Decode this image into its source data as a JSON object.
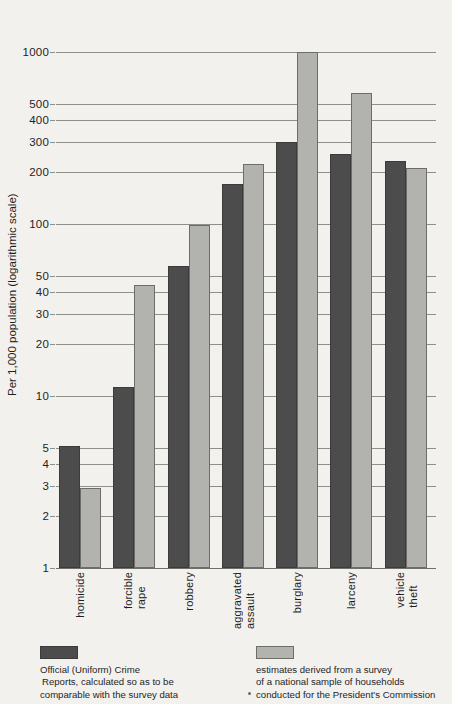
{
  "chart_data": {
    "type": "bar",
    "title": "",
    "xlabel": "",
    "ylabel": "Per 1,000 population (logarithmic scale)",
    "scale": "log",
    "ylim": [
      1,
      1200
    ],
    "grid": true,
    "legend_position": "bottom",
    "ticks": [
      1,
      2,
      3,
      4,
      5,
      10,
      20,
      30,
      40,
      50,
      100,
      200,
      300,
      400,
      500,
      1000
    ],
    "tick_labels": [
      "1",
      "2",
      "3",
      "4",
      "5",
      "10",
      "20",
      "30",
      "40",
      "50",
      "100",
      "200",
      "300",
      "400",
      "500",
      "1000"
    ],
    "categories": [
      "homicide",
      "forcible rape",
      "robbery",
      "aggravated assault",
      "burglary",
      "larceny",
      "vehicle theft"
    ],
    "category_lines": [
      [
        "homicide"
      ],
      [
        "forcible",
        "rape"
      ],
      [
        "robbery"
      ],
      [
        "aggravated",
        "assault"
      ],
      [
        "burglary"
      ],
      [
        "larceny"
      ],
      [
        "vehicle",
        "theft"
      ]
    ],
    "series": [
      {
        "name": "Official (Uniform) Crime Reports, calculated so as to be comparable with the survey data",
        "short_name": "official",
        "color": "#4c4c4c",
        "values": [
          5.1,
          11.3,
          57,
          170,
          298,
          255,
          232
        ]
      },
      {
        "name": "estimates derived from a survey of a national sample of households conducted for the President's Commission",
        "short_name": "survey",
        "color": "#b2b2ae",
        "values": [
          2.9,
          44,
          99,
          222,
          1000,
          580,
          212
        ]
      }
    ]
  },
  "axis": {
    "y_title": "Per 1,000 population (logarithmic scale)"
  },
  "legend": {
    "items": [
      {
        "swatch": "official",
        "line1": "Official (Uniform) Crime",
        "line2": "Reports, calculated so as to be",
        "line3": "comparable with the survey data"
      },
      {
        "swatch": "survey",
        "line1": "estimates derived from a survey",
        "line2": "of a national sample of households",
        "line3": "conducted for the President's Commission"
      }
    ]
  },
  "colors": {
    "official": "#4c4c4c",
    "survey": "#b2b2ae",
    "grid": "#8f8f8a",
    "background": "#f2f1ed",
    "text": "#1f1f1f"
  }
}
